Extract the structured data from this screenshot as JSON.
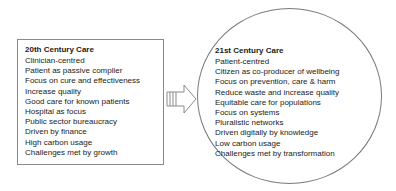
{
  "left_panel": {
    "title": "20th Century Care",
    "items": [
      "Clinician-centred",
      "Patient as passive complier",
      "Focus on cure and effectiveness",
      "Increase quality",
      "Good care for known patients",
      "Hospital as focus",
      "Public sector bureaucracy",
      "Driven by finance",
      "High carbon usage",
      "Challenges met by growth"
    ]
  },
  "arrow": {
    "icon": "striped-right-arrow-icon",
    "stroke_color": "#8a8a8a"
  },
  "right_panel": {
    "title": "21st Century Care",
    "items": [
      "Patient-centred",
      "Citizen as co-producer of wellbeing",
      "Focus on prevention, care & harm",
      "Reduce waste and increase quality",
      "Equitable care for populations",
      "Focus on systems",
      "Pluralistic networks",
      "Driven digitally by knowledge",
      "Low carbon usage",
      "Challenges met by transformation"
    ]
  }
}
